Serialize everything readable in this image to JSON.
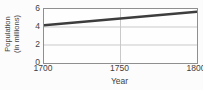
{
  "chart_data": {
    "type": "line",
    "title": "",
    "xlabel": "Year",
    "ylabel": "Population (in millions)",
    "ylabel_lines": [
      "Population",
      "(in millions)"
    ],
    "x": [
      1700,
      1800
    ],
    "values": [
      4.2,
      5.7
    ],
    "xlim": [
      1700,
      1800
    ],
    "ylim": [
      0,
      6
    ],
    "xticks": [
      1700,
      1750,
      1800
    ],
    "yticks": [
      0,
      2,
      4,
      6
    ],
    "grid_x": [
      1750
    ],
    "grid_y": [
      2,
      4
    ],
    "grid_on": true,
    "legend": "none",
    "line_color": "#3d3d3d",
    "grid_color": "#c9c9c9",
    "border_color": "#8f8f8f"
  }
}
